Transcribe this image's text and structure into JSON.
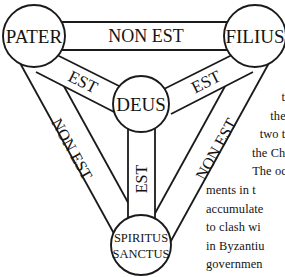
{
  "figure": {
    "name": "scutum-fidei",
    "stroke_color": "#1a1a1a",
    "fill_color": "#ffffff",
    "text_color": "#141414",
    "nodes": [
      {
        "id": "pater",
        "label": "PATER",
        "label2": "",
        "cx": 34,
        "cy": 36,
        "r": 31
      },
      {
        "id": "filius",
        "label": "FILIUS",
        "label2": "",
        "cx": 255,
        "cy": 36,
        "r": 31
      },
      {
        "id": "deus",
        "label": "DEUS",
        "label2": "",
        "cx": 141,
        "cy": 104,
        "r": 28
      },
      {
        "id": "spiritus-sanctus",
        "label": "SPIRITUS",
        "label2": "SANCTUS",
        "cx": 141,
        "cy": 245,
        "r": 30
      }
    ],
    "links": [
      {
        "id": "pater-filius",
        "label": "NON EST",
        "rotation": 0
      },
      {
        "id": "pater-deus",
        "label": "EST",
        "rotation": 30
      },
      {
        "id": "filius-deus",
        "label": "EST",
        "rotation": -30
      },
      {
        "id": "deus-spiritus-sanctus",
        "label": "EST",
        "rotation": -90
      },
      {
        "id": "pater-spiritus-sanctus",
        "label": "NON EST",
        "rotation": 62
      },
      {
        "id": "filius-spiritus-sanctus",
        "label": "NON EST",
        "rotation": -62
      }
    ]
  },
  "body_text": {
    "lines": [
      {
        "text": "to l",
        "align": "right"
      },
      {
        "text": "the N",
        "align": "right"
      },
      {
        "text": "two tho",
        "align": "right"
      },
      {
        "text": "the Chris",
        "align": "right"
      },
      {
        "text": "The occa",
        "align": "right"
      },
      {
        "text": "ments in t",
        "align": "left"
      },
      {
        "text": "accumulate",
        "align": "left"
      },
      {
        "text": "to clash wi",
        "align": "left"
      },
      {
        "text": "in Byzantiu",
        "align": "left"
      },
      {
        "text": "governmen",
        "align": "left"
      }
    ]
  }
}
